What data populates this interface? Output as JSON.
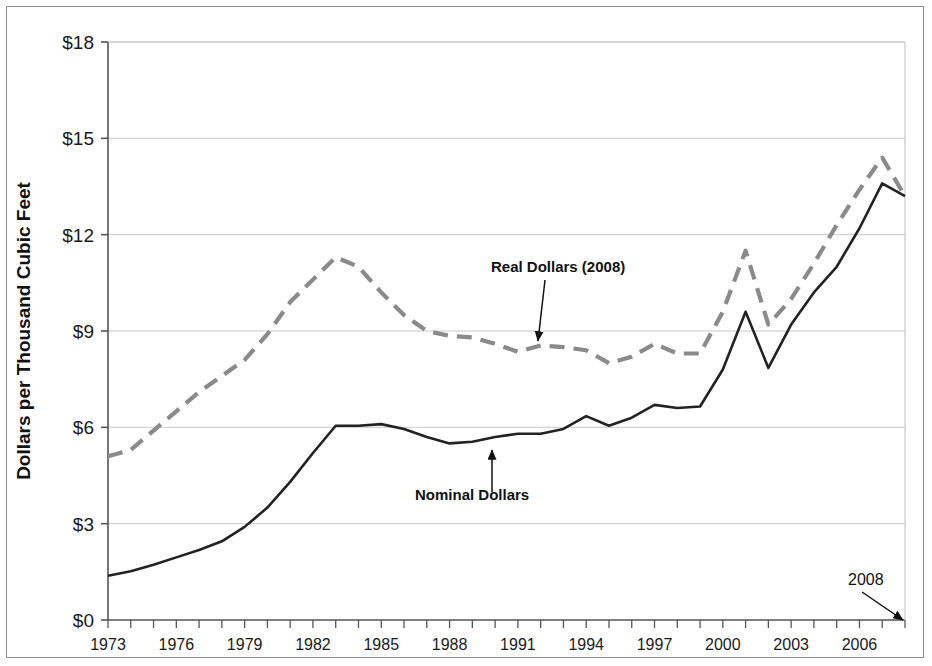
{
  "chart_data": {
    "type": "line",
    "title": "",
    "xlabel": "",
    "ylabel": "Dollars per Thousand Cubic Feet",
    "xlim": [
      1973,
      2008
    ],
    "ylim": [
      0,
      18
    ],
    "y_ticks": [
      0,
      3,
      6,
      9,
      12,
      15,
      18
    ],
    "y_tick_labels": [
      "$0",
      "$3",
      "$6",
      "$9",
      "$12",
      "$15",
      "$18"
    ],
    "x_ticks": [
      1973,
      1974,
      1975,
      1976,
      1977,
      1978,
      1979,
      1980,
      1981,
      1982,
      1983,
      1984,
      1985,
      1986,
      1987,
      1988,
      1989,
      1990,
      1991,
      1992,
      1993,
      1994,
      1995,
      1996,
      1997,
      1998,
      1999,
      2000,
      2001,
      2002,
      2003,
      2004,
      2005,
      2006,
      2007,
      2008
    ],
    "x_tick_labels": [
      "1973",
      "1976",
      "1979",
      "1982",
      "1985",
      "1988",
      "1991",
      "1994",
      "1997",
      "2000",
      "2003",
      "2006"
    ],
    "x_tick_label_years": [
      1973,
      1976,
      1979,
      1982,
      1985,
      1988,
      1991,
      1994,
      1997,
      2000,
      2003,
      2006
    ],
    "grid": "horizontal",
    "legend": "none",
    "x": [
      1973,
      1974,
      1975,
      1976,
      1977,
      1978,
      1979,
      1980,
      1981,
      1982,
      1983,
      1984,
      1985,
      1986,
      1987,
      1988,
      1989,
      1990,
      1991,
      1992,
      1993,
      1994,
      1995,
      1996,
      1997,
      1998,
      1999,
      2000,
      2001,
      2002,
      2003,
      2004,
      2005,
      2006,
      2007,
      2008
    ],
    "series": [
      {
        "name": "Real Dollars (2008)",
        "style": "dashed",
        "color": "#8a8a8a",
        "values": [
          5.1,
          5.3,
          5.9,
          6.5,
          7.1,
          7.6,
          8.1,
          8.9,
          9.9,
          10.6,
          11.3,
          11.0,
          10.2,
          9.5,
          9.0,
          8.85,
          8.8,
          8.6,
          8.35,
          8.55,
          8.5,
          8.4,
          8.0,
          8.2,
          8.6,
          8.3,
          8.3,
          9.6,
          11.5,
          9.2,
          10.0,
          11.1,
          12.3,
          13.4,
          14.4,
          13.2
        ]
      },
      {
        "name": "Nominal Dollars",
        "style": "solid",
        "color": "#222222",
        "values": [
          1.38,
          1.52,
          1.72,
          1.95,
          2.18,
          2.45,
          2.9,
          3.5,
          4.3,
          5.2,
          6.05,
          6.05,
          6.1,
          5.95,
          5.7,
          5.5,
          5.55,
          5.7,
          5.8,
          5.8,
          5.95,
          6.35,
          6.05,
          6.3,
          6.7,
          6.6,
          6.65,
          7.8,
          9.6,
          7.85,
          9.2,
          10.2,
          11.0,
          12.2,
          13.6,
          13.2
        ]
      }
    ],
    "annotations": [
      {
        "text": "Real Dollars (2008)",
        "style": "bold",
        "text_x": 491,
        "text_y": 272,
        "arrow": {
          "x1": 545,
          "y1": 280,
          "x2": 538,
          "y2": 341
        }
      },
      {
        "text": "Nominal Dollars",
        "style": "bold",
        "text_x": 415,
        "text_y": 500,
        "arrow": {
          "x1": 492,
          "y1": 492,
          "x2": 492,
          "y2": 450
        }
      },
      {
        "text": "2008",
        "style": "plain",
        "text_x": 848,
        "text_y": 585,
        "arrow": {
          "x1": 862,
          "y1": 592,
          "x2": 903,
          "y2": 620
        }
      }
    ]
  },
  "colors": {
    "real_series": "#8a8a8a",
    "nominal_series": "#222222",
    "axis": "#555555",
    "grid": "#c9c9c9",
    "frame": "#8d8d8d",
    "text": "#111111"
  }
}
